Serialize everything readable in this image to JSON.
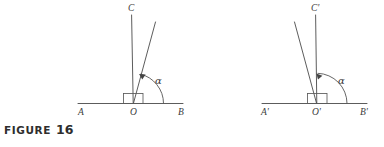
{
  "figure": {
    "caption_word": "FIGURE",
    "caption_number": "16",
    "background_color": "#ffffff",
    "ink_color": "#4a4a4a"
  },
  "diagrams": [
    {
      "id": "left",
      "vertex_label": "O",
      "left_endpoint_label": "A",
      "right_endpoint_label": "B",
      "vertical_ray_label": "C",
      "angle_label": "α",
      "angle_description": "alpha measured from ray OB counterclockwise to the slanted ray",
      "slant_direction": "right-of-vertical",
      "right_angle_marker": "square"
    },
    {
      "id": "right",
      "vertex_label": "O'",
      "left_endpoint_label": "A'",
      "right_endpoint_label": "B'",
      "vertical_ray_label": "C'",
      "angle_label": "α",
      "angle_description": "alpha measured from ray O'B' counterclockwise to the slanted ray",
      "slant_direction": "left-of-vertical",
      "right_angle_marker": "square"
    }
  ]
}
